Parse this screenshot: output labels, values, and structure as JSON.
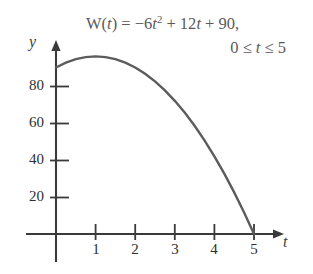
{
  "figure": {
    "title_formula": {
      "function_name": "W",
      "argument": "t",
      "line1": "W(t) = −6t² + 12t + 90,",
      "line1_pre": "W(",
      "line1_var": "t",
      "line1_mid": ") = −6",
      "line1_var2": "t",
      "line1_exp": "2",
      "line1_post": " + 12",
      "line1_var3": "t",
      "line1_end": " + 90,",
      "line2": "0 ≤ t ≤ 5",
      "line2_pre": "0 ≤ ",
      "line2_var": "t",
      "line2_post": " ≤ 5"
    },
    "axes": {
      "y_label": "y",
      "x_label": "t",
      "y_ticks": [
        {
          "value": 20,
          "label": "20"
        },
        {
          "value": 40,
          "label": "40"
        },
        {
          "value": 60,
          "label": "60"
        },
        {
          "value": 80,
          "label": "80"
        }
      ],
      "x_ticks": [
        {
          "value": 1,
          "label": "1"
        },
        {
          "value": 2,
          "label": "2"
        },
        {
          "value": 3,
          "label": "3"
        },
        {
          "value": 4,
          "label": "4"
        },
        {
          "value": 5,
          "label": "5"
        }
      ],
      "axis_color": "#3a3a3a",
      "curve_color": "#5c5c5c"
    }
  },
  "chart_data": {
    "type": "line",
    "equation": "W(t) = -6t^2 + 12t + 90",
    "xlabel": "t",
    "ylabel": "y",
    "xlim": [
      0,
      5.7
    ],
    "ylim": [
      0,
      100
    ],
    "xticks": [
      1,
      2,
      3,
      4,
      5
    ],
    "yticks": [
      20,
      40,
      60,
      80
    ],
    "grid": false,
    "legend": null,
    "domain": [
      0,
      5
    ],
    "x": [
      0,
      0.25,
      0.5,
      0.75,
      1,
      1.25,
      1.5,
      1.75,
      2,
      2.25,
      2.5,
      2.75,
      3,
      3.25,
      3.5,
      3.75,
      4,
      4.25,
      4.5,
      4.75,
      5
    ],
    "y": [
      90,
      92.63,
      94.5,
      95.63,
      96,
      95.63,
      94.5,
      92.63,
      90,
      86.63,
      82.5,
      77.63,
      72,
      65.63,
      58.5,
      50.63,
      42,
      32.63,
      22.5,
      11.63,
      0
    ],
    "vertex": {
      "t": 1,
      "W": 96
    },
    "intercepts": {
      "y_intercept": 90,
      "t_intercept": 5
    }
  }
}
